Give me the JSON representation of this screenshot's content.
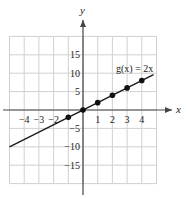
{
  "chart_data": {
    "type": "line",
    "title": "",
    "function_label": "g(x) = 2x",
    "xlabel": "x",
    "ylabel": "y",
    "xlim": [
      -5,
      5
    ],
    "ylim": [
      -20,
      20
    ],
    "grid": true,
    "x_ticks": [
      -4,
      -3,
      -2,
      1,
      2,
      3,
      4
    ],
    "x_tick_labels": [
      "−4",
      "−3",
      "−2",
      "1",
      "2",
      "3",
      "4"
    ],
    "y_ticks": [
      15,
      10,
      5,
      -5,
      -10,
      -15
    ],
    "y_tick_labels": [
      "15",
      "10",
      "5",
      "−5",
      "−10",
      "−15"
    ],
    "series": [
      {
        "name": "g(x) = 2x",
        "line": {
          "x_start": -5,
          "x_end": 5,
          "slope": 2,
          "intercept": 0
        },
        "points": [
          {
            "x": -1,
            "y": -2
          },
          {
            "x": 0,
            "y": 0
          },
          {
            "x": 1,
            "y": 2
          },
          {
            "x": 2,
            "y": 4
          },
          {
            "x": 3,
            "y": 6
          },
          {
            "x": 4,
            "y": 8
          }
        ]
      }
    ],
    "colors": {
      "grid": "#d0d0d0",
      "axis": "#444444",
      "line": "#1a1a1a",
      "point": "#111111"
    }
  }
}
